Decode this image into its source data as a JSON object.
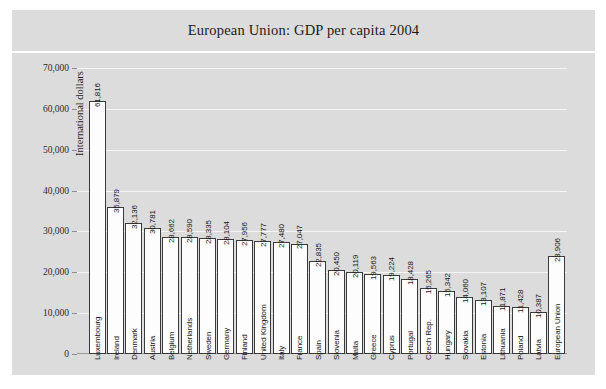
{
  "chart_data": {
    "type": "bar",
    "title": "European Union: GDP per capita 2004",
    "xlabel": "",
    "ylabel": "International dollars",
    "ylim": [
      0,
      70000
    ],
    "ytick_labels": [
      "70,000",
      "60,000",
      "50,000",
      "40,000",
      "30,000",
      "20,000",
      "10,000",
      "0"
    ],
    "ytick_values": [
      70000,
      60000,
      50000,
      40000,
      30000,
      20000,
      10000,
      0
    ],
    "grid": true,
    "legend": "none",
    "categories": [
      "Luxembourg",
      "Ireland",
      "Denmark",
      "Austria",
      "Belgium",
      "Netherlands",
      "Sweden",
      "Germany",
      "Finland",
      "United Kingdom",
      "Italy",
      "France",
      "Spain",
      "Slovenia",
      "Malta",
      "Greece",
      "Cyprus",
      "Portugal",
      "Czech Rep.",
      "Hungary",
      "Slovakia",
      "Estonia",
      "Lithuania",
      "Poland",
      "Latvia",
      "European Union"
    ],
    "values": [
      61816,
      35879,
      32136,
      30781,
      28662,
      28590,
      28335,
      28104,
      27956,
      27777,
      27480,
      27047,
      22835,
      20450,
      20119,
      19563,
      19224,
      18428,
      16265,
      15342,
      14060,
      13107,
      11871,
      11428,
      10387,
      23906
    ],
    "value_labels": [
      "61,816",
      "35,879",
      "32,136",
      "30,781",
      "28,662",
      "28,590",
      "28,335",
      "28,104",
      "27,956",
      "27,777",
      "27,480",
      "27,047",
      "22,835",
      "20,450",
      "20,119",
      "19,563",
      "19,224",
      "18,428",
      "16,265",
      "15,342",
      "14,060",
      "13,107",
      "11,871",
      "11,428",
      "10,387",
      "23,906"
    ],
    "colors": {
      "panel_background": "#dcdcdc",
      "plot_background": "#dcdcdc",
      "bar_fill": "#fdfdfd",
      "bar_edge": "#3a3a3a",
      "gridline": "#f5f5f5",
      "axis": "#8e8e8e",
      "text": "#161616"
    }
  }
}
